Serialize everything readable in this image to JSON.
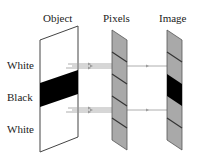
{
  "headers": {
    "object": "Object",
    "pixels": "Pixels",
    "image": "Image"
  },
  "labels": {
    "top": "White",
    "middle": "Black",
    "bottom": "White"
  },
  "colors": {
    "panel_gray": "#a9a9a9",
    "divider": "#3a3a3a",
    "black": "#000000",
    "ray": "#9a9a9a",
    "outline": "#444444"
  },
  "pixel_cells": 5,
  "image_black_cell_index": 2
}
